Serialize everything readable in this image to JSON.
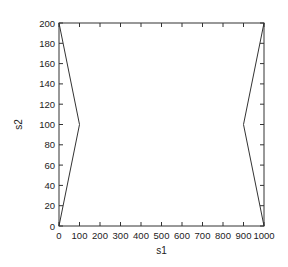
{
  "chart_data": {
    "type": "line",
    "title": "",
    "xlabel": "s1",
    "ylabel": "s2",
    "xlim": [
      0,
      1000
    ],
    "ylim": [
      0,
      200
    ],
    "grid": false,
    "legend": null,
    "x_ticks": [
      0,
      100,
      200,
      300,
      400,
      500,
      600,
      700,
      800,
      900,
      1000
    ],
    "y_ticks": [
      0,
      20,
      40,
      60,
      80,
      100,
      120,
      140,
      160,
      180,
      200
    ],
    "series": [
      {
        "name": "left boundary",
        "x": [
          0,
          100,
          0
        ],
        "y": [
          200,
          100,
          0
        ],
        "color": "#333333"
      },
      {
        "name": "right boundary",
        "x": [
          1000,
          900,
          1000
        ],
        "y": [
          200,
          100,
          0
        ],
        "color": "#333333"
      }
    ]
  },
  "layout": {
    "plot": {
      "left": 59,
      "right": 264,
      "top": 23,
      "bottom": 226
    },
    "axis_color": "#333333"
  }
}
